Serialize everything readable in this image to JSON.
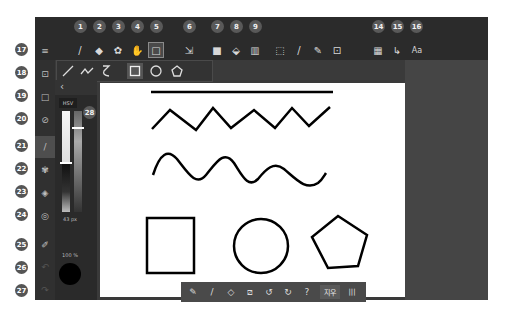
{
  "top_badges": [
    {
      "n": "1",
      "x": 45
    },
    {
      "n": "2",
      "x": 64
    },
    {
      "n": "3",
      "x": 83
    },
    {
      "n": "4",
      "x": 102
    },
    {
      "n": "5",
      "x": 121
    },
    {
      "n": "6",
      "x": 154
    },
    {
      "n": "7",
      "x": 182
    },
    {
      "n": "8",
      "x": 201
    },
    {
      "n": "9",
      "x": 220
    },
    {
      "n": "14",
      "x": 343
    },
    {
      "n": "15",
      "x": 362
    },
    {
      "n": "16",
      "x": 381
    }
  ],
  "side_badges": [
    {
      "n": "17",
      "y": 43
    },
    {
      "n": "18",
      "y": 66
    },
    {
      "n": "19",
      "y": 91
    },
    {
      "n": "20",
      "y": 114
    },
    {
      "n": "21",
      "y": 141
    },
    {
      "n": "22",
      "y": 164
    },
    {
      "n": "23",
      "y": 187
    },
    {
      "n": "24",
      "y": 210
    },
    {
      "n": "25",
      "y": 240
    },
    {
      "n": "26",
      "y": 262
    },
    {
      "n": "27",
      "y": 286
    }
  ],
  "panel_badge": "28",
  "toolbar": {
    "tools": [
      {
        "name": "brush",
        "glyph": "/"
      },
      {
        "name": "eraser",
        "glyph": "◆"
      },
      {
        "name": "lasso-eraser",
        "glyph": "✿"
      },
      {
        "name": "hand",
        "glyph": "✋"
      },
      {
        "name": "shape",
        "glyph": "□"
      },
      {
        "name": "transform",
        "glyph": "⇲"
      },
      {
        "name": "fill-color",
        "glyph": "■"
      },
      {
        "name": "paint-bucket",
        "glyph": "⬙"
      },
      {
        "name": "gradient",
        "glyph": "▥"
      },
      {
        "name": "select-rect",
        "glyph": "⬚"
      },
      {
        "name": "select-brush",
        "glyph": "/"
      },
      {
        "name": "select-pen",
        "glyph": "✎"
      },
      {
        "name": "select-add",
        "glyph": "⊡"
      },
      {
        "name": "layers-grid",
        "glyph": "▦"
      },
      {
        "name": "pointer",
        "glyph": "↳"
      },
      {
        "name": "text",
        "glyph": "Aa"
      }
    ]
  },
  "shape_bar": {
    "items": [
      "line",
      "polyline",
      "curve",
      "rectangle",
      "circle",
      "pentagon"
    ],
    "selected": "rectangle"
  },
  "rail": {
    "items": [
      "menu",
      "canvas-settings",
      "selection",
      "no-brush",
      "brush",
      "brush-settings",
      "layers",
      "compass",
      "eyedropper",
      "undo",
      "redo"
    ],
    "selected": "brush"
  },
  "color_panel": {
    "mode_label": "HSV",
    "collapse_glyph": "‹",
    "size_label": "43 px",
    "opacity_label": "100 %",
    "current_color": "#000000"
  },
  "bottom_bar": {
    "items": [
      "pen",
      "pencil",
      "eraser",
      "no-stroke",
      "undo",
      "redo",
      "help"
    ],
    "text_button": "지우",
    "grid_glyph": "|||"
  },
  "canvas": {
    "background": "#ffffff",
    "stroke": "#000000"
  },
  "colors": {
    "app_bg": "#3a3a3a",
    "toolbar_bg": "#2b2b2b",
    "badge_bg": "#595959"
  }
}
